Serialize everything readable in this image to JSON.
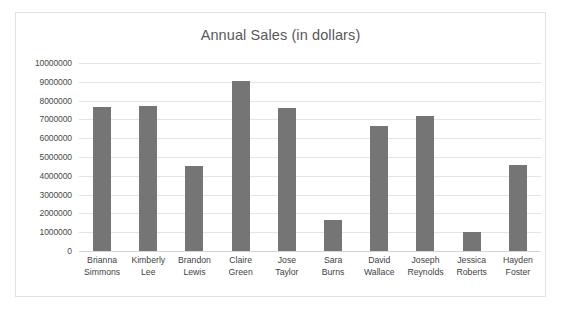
{
  "chart_data": {
    "type": "bar",
    "title": "Annual Sales (in dollars)",
    "xlabel": "",
    "ylabel": "",
    "ylim": [
      0,
      10000000
    ],
    "ytick_step": 1000000,
    "grid": true,
    "legend": false,
    "bar_color": "#757575",
    "gridline_color": "#e4e4e4",
    "title_color": "#58595b",
    "categories": [
      "Brianna Simmons",
      "Kimberly Lee",
      "Brandon Lewis",
      "Claire Green",
      "Jose Taylor",
      "Sara Burns",
      "David Wallace",
      "Joseph Reynolds",
      "Jessica Roberts",
      "Hayden Foster"
    ],
    "category_lines": [
      [
        "Brianna",
        "Simmons"
      ],
      [
        "Kimberly",
        "Lee"
      ],
      [
        "Brandon",
        "Lewis"
      ],
      [
        "Claire",
        "Green"
      ],
      [
        "Jose",
        "Taylor"
      ],
      [
        "Sara",
        "Burns"
      ],
      [
        "David",
        "Wallace"
      ],
      [
        "Joseph",
        "Reynolds"
      ],
      [
        "Jessica",
        "Roberts"
      ],
      [
        "Hayden",
        "Foster"
      ]
    ],
    "values": [
      7650000,
      7700000,
      4500000,
      9050000,
      7600000,
      1650000,
      6650000,
      7200000,
      1000000,
      4600000
    ],
    "ytick_labels": [
      "10000000",
      "9000000",
      "8000000",
      "7000000",
      "6000000",
      "5000000",
      "4000000",
      "3000000",
      "2000000",
      "1000000",
      "0"
    ],
    "ytick_values": [
      10000000,
      9000000,
      8000000,
      7000000,
      6000000,
      5000000,
      4000000,
      3000000,
      2000000,
      1000000,
      0
    ]
  }
}
